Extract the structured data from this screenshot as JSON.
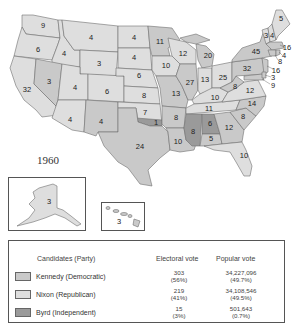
{
  "title_fragment": "",
  "year_label": "1960",
  "colors": {
    "kennedy": "#c9c9c9",
    "nixon": "#dedede",
    "byrd": "#9a9a9a",
    "border": "#6e6e6e",
    "background": "#ffffff"
  },
  "states": [
    {
      "name": "Washington",
      "ev": "9",
      "party": "nixon"
    },
    {
      "name": "Oregon",
      "ev": "6",
      "party": "nixon"
    },
    {
      "name": "California",
      "ev": "32",
      "party": "nixon"
    },
    {
      "name": "Idaho",
      "ev": "4",
      "party": "nixon"
    },
    {
      "name": "Nevada",
      "ev": "3",
      "party": "kennedy"
    },
    {
      "name": "Montana",
      "ev": "4",
      "party": "nixon"
    },
    {
      "name": "Wyoming",
      "ev": "3",
      "party": "nixon"
    },
    {
      "name": "Utah",
      "ev": "4",
      "party": "nixon"
    },
    {
      "name": "Arizona",
      "ev": "4",
      "party": "nixon"
    },
    {
      "name": "Colorado",
      "ev": "6",
      "party": "nixon"
    },
    {
      "name": "New Mexico",
      "ev": "4",
      "party": "kennedy"
    },
    {
      "name": "North Dakota",
      "ev": "4",
      "party": "nixon"
    },
    {
      "name": "South Dakota",
      "ev": "4",
      "party": "nixon"
    },
    {
      "name": "Nebraska",
      "ev": "6",
      "party": "nixon"
    },
    {
      "name": "Kansas",
      "ev": "8",
      "party": "nixon"
    },
    {
      "name": "Oklahoma",
      "ev": "7",
      "party": "nixon"
    },
    {
      "name": "Oklahoma (Byrd)",
      "ev": "1",
      "party": "byrd"
    },
    {
      "name": "Texas",
      "ev": "24",
      "party": "kennedy"
    },
    {
      "name": "Minnesota",
      "ev": "11",
      "party": "kennedy"
    },
    {
      "name": "Iowa",
      "ev": "10",
      "party": "nixon"
    },
    {
      "name": "Missouri",
      "ev": "13",
      "party": "kennedy"
    },
    {
      "name": "Arkansas",
      "ev": "8",
      "party": "kennedy"
    },
    {
      "name": "Louisiana",
      "ev": "10",
      "party": "kennedy"
    },
    {
      "name": "Wisconsin",
      "ev": "12",
      "party": "nixon"
    },
    {
      "name": "Illinois",
      "ev": "27",
      "party": "kennedy"
    },
    {
      "name": "Michigan",
      "ev": "20",
      "party": "kennedy"
    },
    {
      "name": "Indiana",
      "ev": "13",
      "party": "nixon"
    },
    {
      "name": "Ohio",
      "ev": "25",
      "party": "nixon"
    },
    {
      "name": "Kentucky",
      "ev": "10",
      "party": "nixon"
    },
    {
      "name": "Tennessee",
      "ev": "11",
      "party": "nixon"
    },
    {
      "name": "Mississippi",
      "ev": "8",
      "party": "byrd"
    },
    {
      "name": "Alabama (Byrd)",
      "ev": "6",
      "party": "byrd"
    },
    {
      "name": "Alabama (Kennedy)",
      "ev": "5",
      "party": "kennedy"
    },
    {
      "name": "Georgia",
      "ev": "12",
      "party": "kennedy"
    },
    {
      "name": "Florida",
      "ev": "10",
      "party": "nixon"
    },
    {
      "name": "South Carolina",
      "ev": "8",
      "party": "kennedy"
    },
    {
      "name": "North Carolina",
      "ev": "14",
      "party": "kennedy"
    },
    {
      "name": "Virginia",
      "ev": "12",
      "party": "nixon"
    },
    {
      "name": "West Virginia",
      "ev": "8",
      "party": "kennedy"
    },
    {
      "name": "Pennsylvania",
      "ev": "32",
      "party": "kennedy"
    },
    {
      "name": "New York",
      "ev": "45",
      "party": "kennedy"
    },
    {
      "name": "Vermont",
      "ev": "3",
      "party": "nixon"
    },
    {
      "name": "New Hampshire",
      "ev": "4",
      "party": "nixon"
    },
    {
      "name": "Maine",
      "ev": "5",
      "party": "nixon"
    },
    {
      "name": "Massachusetts",
      "ev": "16",
      "party": "kennedy"
    },
    {
      "name": "Rhode Island",
      "ev": "4",
      "party": "kennedy"
    },
    {
      "name": "Connecticut",
      "ev": "8",
      "party": "kennedy"
    },
    {
      "name": "New Jersey",
      "ev": "16",
      "party": "kennedy"
    },
    {
      "name": "Delaware",
      "ev": "3",
      "party": "kennedy"
    },
    {
      "name": "Maryland",
      "ev": "9",
      "party": "kennedy"
    },
    {
      "name": "Alaska",
      "ev": "3",
      "party": "nixon"
    },
    {
      "name": "Hawaii",
      "ev": "3",
      "party": "kennedy"
    }
  ],
  "legend": {
    "headers": {
      "candidates": "Candidates (Party)",
      "electoral": "Electoral vote",
      "popular": "Popular vote"
    },
    "rows": [
      {
        "candidate": "Kennedy (Democratic)",
        "party": "kennedy",
        "electoral": "303",
        "electoral_pct": "(56%)",
        "popular": "34,227,096",
        "popular_pct": "(49.7%)"
      },
      {
        "candidate": "Nixon (Republican)",
        "party": "nixon",
        "electoral": "219",
        "electoral_pct": "(41%)",
        "popular": "34,108,546",
        "popular_pct": "(49.5%)"
      },
      {
        "candidate": "Byrd (Independent)",
        "party": "byrd",
        "electoral": "15",
        "electoral_pct": "(3%)",
        "popular": "501,643",
        "popular_pct": "(0.7%)"
      }
    ]
  }
}
